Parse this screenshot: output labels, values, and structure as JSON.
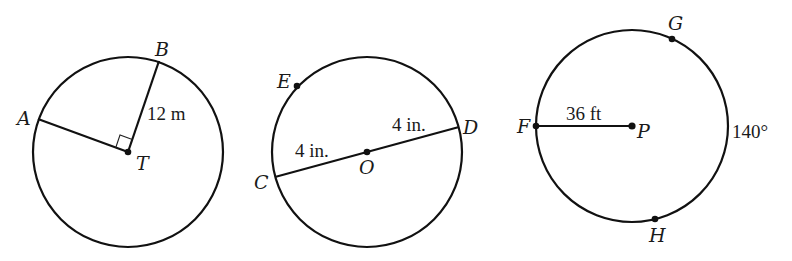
{
  "diagram": {
    "type": "geometry-circles",
    "stroke_color": "#111111",
    "background": "#ffffff",
    "figures": [
      {
        "id": "circle-T",
        "center": {
          "label": "T",
          "x": 128,
          "y": 152
        },
        "radius_px": 95,
        "points": [
          {
            "label": "A",
            "x": 38,
            "y": 119
          },
          {
            "label": "B",
            "x": 159,
            "y": 61
          }
        ],
        "segments": [
          {
            "from": "T",
            "to": "A"
          },
          {
            "from": "T",
            "to": "B",
            "measure": "12 m"
          }
        ],
        "right_angle_at": "T"
      },
      {
        "id": "circle-O",
        "center": {
          "label": "O",
          "x": 367,
          "y": 152
        },
        "radius_px": 95,
        "points": [
          {
            "label": "C",
            "x": 275,
            "y": 177
          },
          {
            "label": "D",
            "x": 459,
            "y": 127
          },
          {
            "label": "E",
            "x": 297,
            "y": 86
          }
        ],
        "segments": [
          {
            "from": "C",
            "to": "O",
            "measure": "4 in."
          },
          {
            "from": "O",
            "to": "D",
            "measure": "4 in."
          }
        ]
      },
      {
        "id": "circle-P",
        "center": {
          "label": "P",
          "x": 632,
          "y": 126
        },
        "radius_px": 96,
        "points": [
          {
            "label": "F",
            "x": 536,
            "y": 126
          },
          {
            "label": "G",
            "x": 672,
            "y": 39
          },
          {
            "label": "H",
            "x": 655,
            "y": 219
          }
        ],
        "segments": [
          {
            "from": "F",
            "to": "P",
            "measure": "36 ft"
          }
        ],
        "arc_measure": {
          "arc": "GH",
          "value": "140°"
        }
      }
    ]
  },
  "labels": {
    "A": "A",
    "B": "B",
    "T": "T",
    "measure_TB": "12 m",
    "C": "C",
    "D": "D",
    "E": "E",
    "O": "O",
    "measure_CO": "4 in.",
    "measure_OD": "4 in.",
    "F": "F",
    "G": "G",
    "H": "H",
    "P": "P",
    "measure_FP": "36 ft",
    "arc_GH": "140°"
  }
}
